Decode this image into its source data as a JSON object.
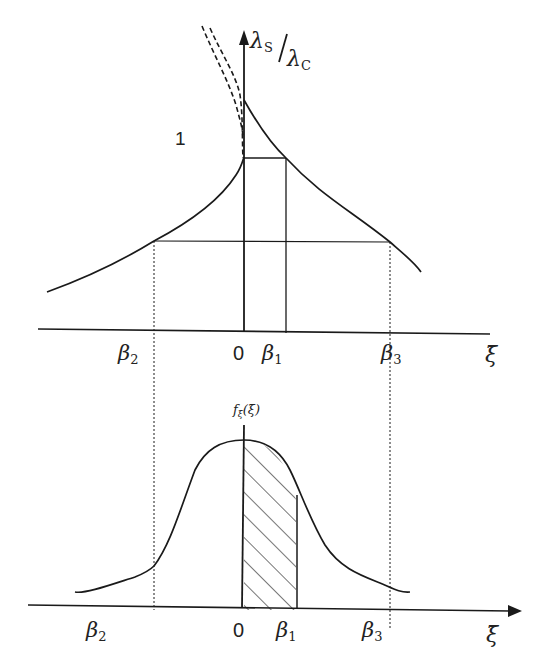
{
  "top_plot": {
    "y_axis_label_num": "λ",
    "y_axis_label_num_sub": "S",
    "y_axis_label_den": "λ",
    "y_axis_label_den_sub": "C",
    "curve_label": "1",
    "x_axis_label": "ξ̄",
    "ticks": [
      {
        "name": "beta2",
        "base": "β",
        "sub": "2"
      },
      {
        "name": "zero",
        "base": "0",
        "sub": ""
      },
      {
        "name": "beta1",
        "base": "β",
        "sub": "1"
      },
      {
        "name": "beta3",
        "base": "β",
        "sub": "3"
      }
    ]
  },
  "bottom_plot": {
    "y_axis_label": "f",
    "y_axis_label_sub": "ξ̄",
    "y_axis_label_arg": "(ξ̄)",
    "x_axis_label": "ξ̄",
    "ticks": [
      {
        "name": "beta2",
        "base": "β",
        "sub": "2"
      },
      {
        "name": "zero",
        "base": "0",
        "sub": ""
      },
      {
        "name": "beta1",
        "base": "β",
        "sub": "1"
      },
      {
        "name": "beta3",
        "base": "β",
        "sub": "3"
      }
    ],
    "shaded_region": "0 to β1"
  },
  "colors": {
    "stroke": "#1a1a1a",
    "background": "#ffffff"
  }
}
